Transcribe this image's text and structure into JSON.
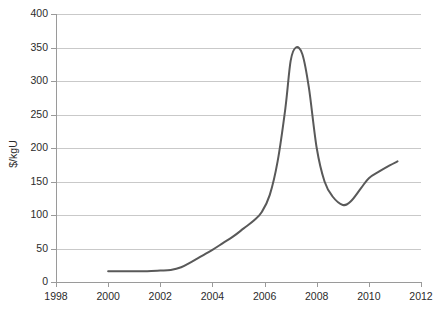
{
  "chart_data": {
    "type": "line",
    "title": "",
    "subtitle": "",
    "xlabel": "",
    "ylabel": "$/kgU",
    "xlim": [
      1998,
      2012
    ],
    "ylim": [
      0,
      400
    ],
    "grid": "horizontal",
    "legend": "none",
    "x_ticks": [
      1998,
      2000,
      2002,
      2004,
      2006,
      2008,
      2010,
      2012
    ],
    "x_tick_labels": [
      "1998",
      "2000",
      "2002",
      "2004",
      "2006",
      "2008",
      "2010",
      "2012"
    ],
    "y_ticks": [
      0,
      50,
      100,
      150,
      200,
      250,
      300,
      350,
      400
    ],
    "y_tick_labels": [
      "0",
      "50",
      "100",
      "150",
      "200",
      "250",
      "300",
      "350",
      "400"
    ],
    "series": [
      {
        "name": "Uranium price",
        "color": "#595959",
        "line_width": 2,
        "x": [
          2000.0,
          2000.5,
          2001.0,
          2001.5,
          2002.0,
          2002.4,
          2002.8,
          2003.2,
          2003.6,
          2004.0,
          2004.4,
          2004.8,
          2005.2,
          2005.6,
          2005.9,
          2006.2,
          2006.5,
          2006.8,
          2007.0,
          2007.2,
          2007.45,
          2007.7,
          2008.0,
          2008.3,
          2008.6,
          2009.0,
          2009.3,
          2009.7,
          2010.0,
          2010.4,
          2010.8,
          2011.1
        ],
        "y": [
          16,
          16,
          16,
          16,
          17,
          18,
          22,
          30,
          39,
          48,
          58,
          68,
          80,
          92,
          105,
          130,
          180,
          260,
          330,
          350,
          340,
          290,
          200,
          150,
          128,
          115,
          120,
          140,
          155,
          165,
          174,
          180
        ]
      }
    ],
    "annotations": []
  },
  "axis_style": {
    "grid_color": "#c9c9c9",
    "axis_color": "#9a9a9a",
    "text_color": "#2b2b2b",
    "background": "#ffffff"
  }
}
